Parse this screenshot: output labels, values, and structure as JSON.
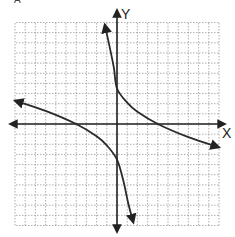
{
  "graph": {
    "partial_label": "A",
    "x_axis_label": "X",
    "y_axis_label": "Y",
    "grid": {
      "x_min": -10,
      "x_max": 10,
      "y_min": -10,
      "y_max": 10,
      "step": 1
    },
    "colors": {
      "grid": "#9a9a9a",
      "axis": "#222222",
      "curve": "#2a2a2a",
      "background": "#ffffff"
    }
  },
  "chart_data": {
    "type": "line",
    "title": "",
    "xlabel": "X",
    "ylabel": "Y",
    "xlim": [
      -10,
      10
    ],
    "ylim": [
      -10,
      10
    ],
    "grid": true,
    "series": [
      {
        "name": "left-branch",
        "points": [
          [
            -10,
            2.3
          ],
          [
            -7,
            1.3
          ],
          [
            -4,
            0
          ],
          [
            -2,
            -1.2
          ],
          [
            -1,
            -2.1
          ],
          [
            0,
            -3.5
          ],
          [
            0.6,
            -5.5
          ],
          [
            1.1,
            -7.8
          ],
          [
            1.6,
            -9.7
          ]
        ]
      },
      {
        "name": "right-branch",
        "points": [
          [
            -1.2,
            9.8
          ],
          [
            -0.7,
            7.5
          ],
          [
            -0.3,
            5.5
          ],
          [
            0,
            3.5
          ],
          [
            1,
            2.1
          ],
          [
            2,
            1.2
          ],
          [
            4,
            0
          ],
          [
            7,
            -1.3
          ],
          [
            10,
            -2.3
          ]
        ]
      }
    ]
  }
}
